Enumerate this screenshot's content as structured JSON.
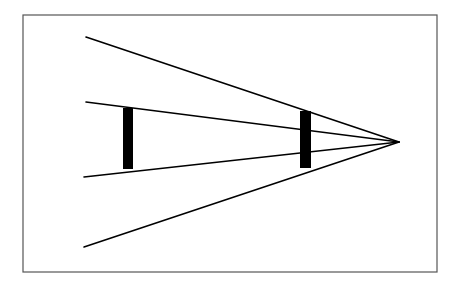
{
  "figure": {
    "name": "ponzo-illusion",
    "caption": "",
    "canvas": {
      "width": 463,
      "height": 288
    },
    "background_color": "#ffffff",
    "ink_color": "#000000",
    "border_color": "#555555"
  },
  "frame": {
    "name": "figure-border",
    "x": 23,
    "y": 15,
    "width": 414,
    "height": 257,
    "stroke_width": 1.2,
    "color": "#555555",
    "fill": "#ffffff"
  },
  "vanishing_point": {
    "label": "convergence-point",
    "x": 399,
    "y": 142
  },
  "converging_lines": [
    {
      "name": "outer-upper-line",
      "x1": 86,
      "y1": 37,
      "x2": 399,
      "y2": 142,
      "stroke_width": 1.6
    },
    {
      "name": "inner-upper-line",
      "x1": 86,
      "y1": 102,
      "x2": 399,
      "y2": 142,
      "stroke_width": 1.6
    },
    {
      "name": "inner-lower-line",
      "x1": 84,
      "y1": 177,
      "x2": 399,
      "y2": 142,
      "stroke_width": 1.6
    },
    {
      "name": "outer-lower-line",
      "x1": 84,
      "y1": 247,
      "x2": 399,
      "y2": 142,
      "stroke_width": 1.6
    }
  ],
  "bars": [
    {
      "name": "left-bar",
      "position_label": "near",
      "x": 123,
      "y": 108,
      "width": 10,
      "height": 61,
      "color": "#000000"
    },
    {
      "name": "right-bar",
      "position_label": "far",
      "x": 300,
      "y": 111,
      "width": 11,
      "height": 57,
      "color": "#000000"
    }
  ],
  "chart_data": {
    "type": "diagram",
    "xlabel": "",
    "ylabel": "",
    "grid": false,
    "legend": "none",
    "elements": [
      {
        "kind": "line",
        "id": "outer-upper-line",
        "from": [
          86,
          37
        ],
        "to": [
          399,
          142
        ]
      },
      {
        "kind": "line",
        "id": "inner-upper-line",
        "from": [
          86,
          102
        ],
        "to": [
          399,
          142
        ]
      },
      {
        "kind": "line",
        "id": "inner-lower-line",
        "from": [
          84,
          177
        ],
        "to": [
          399,
          142
        ]
      },
      {
        "kind": "line",
        "id": "outer-lower-line",
        "from": [
          84,
          247
        ],
        "to": [
          399,
          142
        ]
      },
      {
        "kind": "rect",
        "id": "left-bar",
        "xy": [
          123,
          108
        ],
        "width": 10,
        "height": 61
      },
      {
        "kind": "rect",
        "id": "right-bar",
        "xy": [
          300,
          111
        ],
        "width": 11,
        "height": 57
      },
      {
        "kind": "rect",
        "id": "figure-border",
        "xy": [
          23,
          15
        ],
        "width": 414,
        "height": 257
      }
    ]
  }
}
